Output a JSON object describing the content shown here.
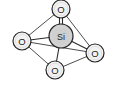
{
  "figure": {
    "name": "silicon-oxygen-polyhedron",
    "background_color": "#ffffff",
    "width": 114,
    "height": 85,
    "outline_color": "#262626",
    "oxygen_fill": "#f2f2f2",
    "silicon_fill": "#cfcfcf",
    "bond_color": "#2b2b2b"
  },
  "atoms": [
    {
      "id": "o-top",
      "label": "O",
      "element": "O",
      "cx": 61,
      "cy": 9,
      "r": 9
    },
    {
      "id": "o-left",
      "label": "O",
      "element": "O",
      "cx": 22,
      "cy": 41,
      "r": 9
    },
    {
      "id": "o-right",
      "label": "O",
      "element": "O",
      "cx": 95,
      "cy": 53,
      "r": 9
    },
    {
      "id": "o-bottom",
      "label": "O",
      "element": "O",
      "cx": 55,
      "cy": 70,
      "r": 9
    },
    {
      "id": "si-center",
      "label": "Si",
      "element": "Si",
      "cx": 61,
      "cy": 36,
      "r": 12
    }
  ],
  "bonds": [
    {
      "id": "bond-si-o-top",
      "from": "si-center",
      "to": "o-top",
      "order": 2
    },
    {
      "id": "bond-si-o-left",
      "from": "si-center",
      "to": "o-left",
      "order": 1
    },
    {
      "id": "bond-si-o-right",
      "from": "si-center",
      "to": "o-right",
      "order": 1
    },
    {
      "id": "bond-si-o-bottom",
      "from": "si-center",
      "to": "o-bottom",
      "order": 1
    },
    {
      "id": "edge-top-left",
      "from": "o-top",
      "to": "o-left",
      "order": 1
    },
    {
      "id": "edge-top-right",
      "from": "o-top",
      "to": "o-right",
      "order": 1
    },
    {
      "id": "edge-left-bottom",
      "from": "o-left",
      "to": "o-bottom",
      "order": 1
    },
    {
      "id": "edge-left-right",
      "from": "o-left",
      "to": "o-right",
      "order": 1
    },
    {
      "id": "edge-bottom-right",
      "from": "o-bottom",
      "to": "o-right",
      "order": 1
    }
  ]
}
